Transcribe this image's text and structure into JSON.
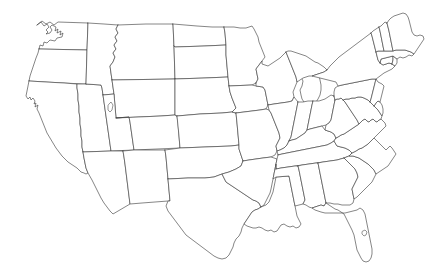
{
  "figure": {
    "kind": "outline-map",
    "title": "United States state outline map",
    "region": "Contiguous United States",
    "background_color": "#ffffff",
    "outline_color": "#3a3a3a",
    "fill_color": "#ffffff",
    "line_width_px": 0.62,
    "labels_shown": false,
    "legend_shown": false,
    "has_border_frame": false,
    "width_px": 434,
    "height_px": 273
  },
  "map_features": {
    "water_bodies": [
      "Great Salt Lake",
      "Lake Okeechobee",
      "Puget Sound",
      "Chesapeake Bay",
      "Great Lakes shoreline",
      "Mississippi River Delta"
    ],
    "state_count": 49,
    "states": [
      "Washington",
      "Oregon",
      "California",
      "Nevada",
      "Idaho",
      "Montana",
      "Wyoming",
      "Utah",
      "Arizona",
      "Colorado",
      "New Mexico",
      "North Dakota",
      "South Dakota",
      "Nebraska",
      "Kansas",
      "Oklahoma",
      "Texas",
      "Minnesota",
      "Iowa",
      "Missouri",
      "Arkansas",
      "Louisiana",
      "Wisconsin",
      "Illinois",
      "Michigan",
      "Indiana",
      "Ohio",
      "Kentucky",
      "Tennessee",
      "Mississippi",
      "Alabama",
      "Georgia",
      "Florida",
      "South Carolina",
      "North Carolina",
      "Virginia",
      "West Virginia",
      "Maryland",
      "Delaware",
      "Pennsylvania",
      "New Jersey",
      "New York",
      "Connecticut",
      "Rhode Island",
      "Massachusetts",
      "Vermont",
      "New Hampshire",
      "Maine",
      "District of Columbia"
    ]
  }
}
